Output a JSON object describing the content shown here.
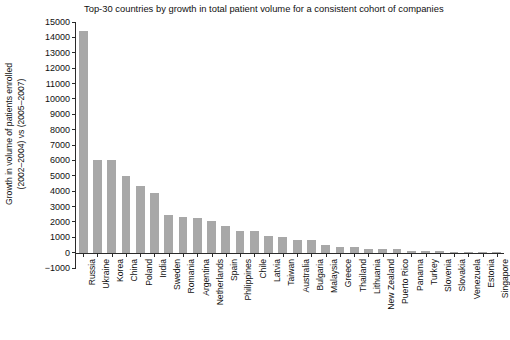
{
  "chart_data": {
    "type": "bar",
    "title": "Top-30 countries by growth in total patient volume for a consistent cohort of companies",
    "xlabel": "",
    "ylabel_line1": "Growth in volume of patients enrolled",
    "ylabel_line2": "(2002–2004) vs (2005–2007)",
    "ylim": [
      -1000,
      15000
    ],
    "ytick_labels": [
      "15000",
      "14000",
      "13000",
      "12000",
      "11000",
      "10000",
      "9000",
      "8000",
      "7000",
      "6000",
      "5000",
      "4000",
      "3000",
      "2000",
      "1000",
      "0",
      "−1000"
    ],
    "ytick_values": [
      15000,
      14000,
      13000,
      12000,
      11000,
      10000,
      9000,
      8000,
      7000,
      6000,
      5000,
      4000,
      3000,
      2000,
      1000,
      0,
      -1000
    ],
    "grid": false,
    "legend": "none",
    "bar_color": "#a8a8a8",
    "categories": [
      "Russia",
      "Ukraine",
      "Korea",
      "China",
      "Poland",
      "India",
      "Sweden",
      "Romania",
      "Argentina",
      "Netherlands",
      "Spain",
      "Philippines",
      "Chile",
      "Latvia",
      "Taiwan",
      "Australia",
      "Bulgaria",
      "Malaysia",
      "Greece",
      "Thailand",
      "Lithuania",
      "New Zealand",
      "Puerto Rico",
      "Panama",
      "Turkey",
      "Slovenia",
      "Slovakia",
      "Venezuela",
      "Estonia",
      "Singapore"
    ],
    "values": [
      14400,
      6050,
      6030,
      4980,
      4350,
      3870,
      2470,
      2300,
      2270,
      2050,
      1750,
      1420,
      1380,
      1070,
      990,
      840,
      790,
      480,
      390,
      370,
      250,
      220,
      210,
      130,
      120,
      90,
      70,
      60,
      40,
      30
    ]
  }
}
